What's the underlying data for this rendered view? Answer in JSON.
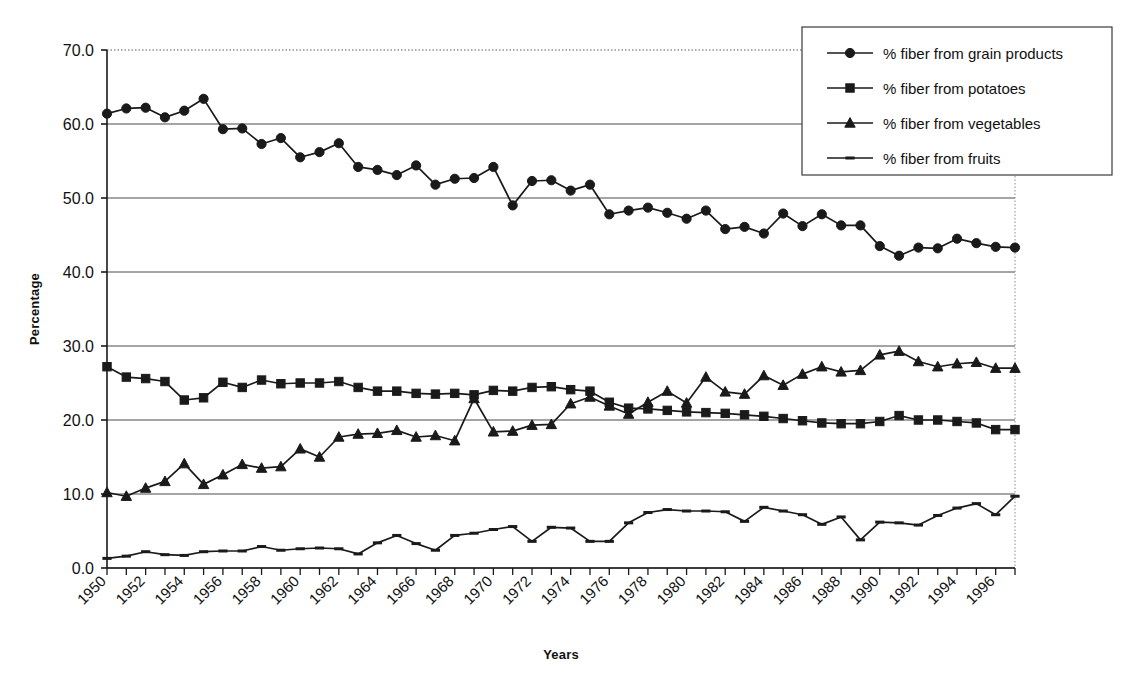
{
  "chart_data": {
    "type": "line",
    "title": "",
    "xlabel": "Years",
    "ylabel": "Percentage",
    "ylim": [
      0.0,
      70.0
    ],
    "xlim": [
      1950,
      1997
    ],
    "ytick_labels": [
      "0.0",
      "10.0",
      "20.0",
      "30.0",
      "40.0",
      "50.0",
      "60.0",
      "70.0"
    ],
    "ytick_values": [
      0.0,
      10.0,
      20.0,
      30.0,
      40.0,
      50.0,
      60.0,
      70.0
    ],
    "grid": "horizontal",
    "legend_position": "top-right",
    "x": [
      1950,
      1951,
      1952,
      1953,
      1954,
      1955,
      1956,
      1957,
      1958,
      1959,
      1960,
      1961,
      1962,
      1963,
      1964,
      1965,
      1966,
      1967,
      1968,
      1969,
      1970,
      1971,
      1972,
      1973,
      1974,
      1975,
      1976,
      1977,
      1978,
      1979,
      1980,
      1981,
      1982,
      1983,
      1984,
      1985,
      1986,
      1987,
      1988,
      1989,
      1990,
      1991,
      1992,
      1993,
      1994,
      1995,
      1996,
      1997
    ],
    "xtick_labels": [
      "1950",
      "1952",
      "1954",
      "1956",
      "1958",
      "1960",
      "1962",
      "1964",
      "1966",
      "1968",
      "1970",
      "1972",
      "1974",
      "1976",
      "1978",
      "1980",
      "1982",
      "1984",
      "1986",
      "1988",
      "1990",
      "1992",
      "1994",
      "1996"
    ],
    "xtick_values": [
      1950,
      1952,
      1954,
      1956,
      1958,
      1960,
      1962,
      1964,
      1966,
      1968,
      1970,
      1972,
      1974,
      1976,
      1978,
      1980,
      1982,
      1984,
      1986,
      1988,
      1990,
      1992,
      1994,
      1996
    ],
    "series": [
      {
        "name": "% fiber from grain products",
        "marker": "circle",
        "dash": "solid",
        "color": "#1a1a1a",
        "values": [
          61.4,
          62.1,
          62.2,
          60.9,
          61.8,
          63.4,
          59.3,
          59.4,
          57.3,
          58.1,
          55.5,
          56.2,
          57.4,
          54.2,
          53.8,
          53.1,
          54.4,
          51.8,
          52.6,
          52.7,
          54.2,
          49.0,
          52.3,
          52.4,
          51.0,
          51.8,
          47.8,
          48.3,
          48.7,
          48.0,
          47.2,
          48.3,
          45.8,
          46.1,
          45.2,
          47.9,
          46.2,
          47.8,
          46.3,
          46.3,
          43.5,
          42.2,
          43.3,
          43.2,
          44.5,
          43.9,
          43.4,
          43.3
        ]
      },
      {
        "name": "% fiber from potatoes",
        "marker": "square",
        "dash": "solid",
        "color": "#1a1a1a",
        "values": [
          27.2,
          25.8,
          25.6,
          25.2,
          22.7,
          23.0,
          25.1,
          24.4,
          25.4,
          24.9,
          25.0,
          25.0,
          25.2,
          24.4,
          23.9,
          23.9,
          23.6,
          23.5,
          23.6,
          23.4,
          24.0,
          23.9,
          24.4,
          24.5,
          24.1,
          23.9,
          22.4,
          21.6,
          21.5,
          21.3,
          21.1,
          21.0,
          20.9,
          20.7,
          20.5,
          20.2,
          19.9,
          19.6,
          19.5,
          19.5,
          19.8,
          20.6,
          20.0,
          20.0,
          19.8,
          19.6,
          18.7,
          18.7
        ]
      },
      {
        "name": "% fiber from vegetables",
        "marker": "triangle",
        "dash": "solid",
        "color": "#1a1a1a",
        "values": [
          10.2,
          9.7,
          10.8,
          11.7,
          14.1,
          11.3,
          12.6,
          14.0,
          13.5,
          13.7,
          16.1,
          15.0,
          17.7,
          18.1,
          18.2,
          18.6,
          17.7,
          17.9,
          17.2,
          22.9,
          18.4,
          18.5,
          19.3,
          19.4,
          22.2,
          23.1,
          21.9,
          20.8,
          22.4,
          23.9,
          22.3,
          25.8,
          23.8,
          23.5,
          26.0,
          24.7,
          26.2,
          27.2,
          26.5,
          26.7,
          28.8,
          29.3,
          27.9,
          27.2,
          27.6,
          27.8,
          27.0,
          27.0
        ]
      },
      {
        "name": "% fiber from fruits",
        "marker": "dash",
        "dash": "solid",
        "color": "#1a1a1a",
        "values": [
          1.3,
          1.6,
          2.2,
          1.8,
          1.7,
          2.2,
          2.3,
          2.3,
          2.9,
          2.4,
          2.6,
          2.7,
          2.6,
          1.9,
          3.4,
          4.4,
          3.3,
          2.4,
          4.4,
          4.7,
          5.2,
          5.6,
          3.6,
          5.5,
          5.4,
          3.6,
          3.6,
          6.1,
          7.5,
          7.9,
          7.7,
          7.7,
          7.6,
          6.3,
          8.2,
          7.7,
          7.2,
          5.9,
          6.9,
          3.8,
          6.2,
          6.1,
          5.8,
          7.1,
          8.1,
          8.7,
          7.2,
          9.7
        ]
      }
    ]
  },
  "legend": {
    "items": [
      {
        "label": "% fiber from grain products",
        "marker": "circle"
      },
      {
        "label": "% fiber from potatoes",
        "marker": "square"
      },
      {
        "label": "% fiber from vegetables",
        "marker": "triangle"
      },
      {
        "label": "% fiber from fruits",
        "marker": "dash"
      }
    ]
  }
}
